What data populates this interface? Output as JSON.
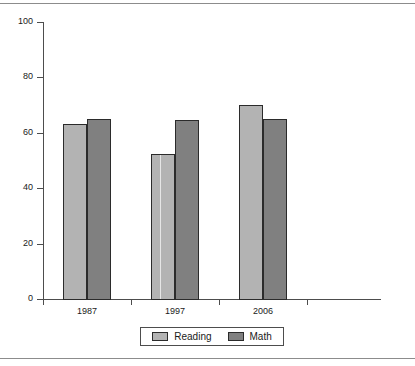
{
  "chart_data": {
    "type": "bar",
    "title": "",
    "xlabel": "",
    "ylabel": "",
    "categories": [
      "1987",
      "1997",
      "2006"
    ],
    "series": [
      {
        "name": "Reading",
        "values": [
          63,
          52.5,
          70
        ],
        "color": "#b3b3b3"
      },
      {
        "name": "Math",
        "values": [
          65,
          64.5,
          65
        ],
        "color": "#808080"
      }
    ],
    "ylim": [
      0,
      100
    ],
    "ytick_labels": [
      "0",
      "20",
      "40",
      "60",
      "80",
      "100"
    ],
    "ytick_values": [
      0,
      20,
      40,
      60,
      80,
      100
    ],
    "grid": false,
    "legend_position": "bottom-center"
  },
  "legend": {
    "entries": [
      {
        "label": "Reading",
        "swatch": "reading-swatch"
      },
      {
        "label": "Math",
        "swatch": "math-swatch"
      }
    ]
  },
  "colors": {
    "reading": "#b3b3b3",
    "math": "#808080",
    "axis": "#4d4d4d",
    "text": "#1a1a1a",
    "frame_rule": "#8c8c8c",
    "background": "#ffffff"
  }
}
